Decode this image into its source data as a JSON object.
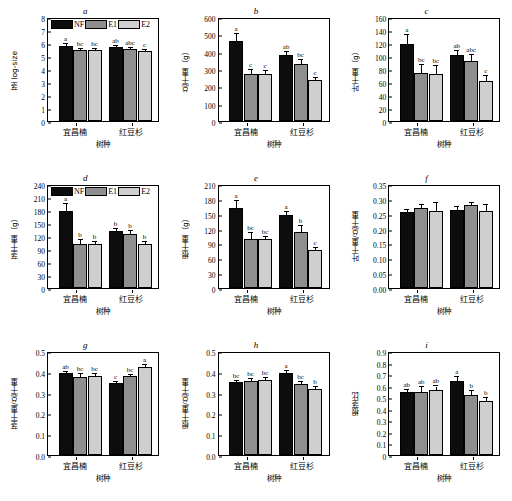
{
  "figure": {
    "categories": [
      "宜昌楠",
      "红豆杉"
    ],
    "xlabel": "树种",
    "legend": [
      {
        "key": "NF",
        "label": "NF",
        "color": "#0d0d0d"
      },
      {
        "key": "E1",
        "label": "E1",
        "color": "#8f8f8f"
      },
      {
        "key": "E2",
        "label": "E2",
        "color": "#cfcfcf"
      }
    ]
  },
  "chart_data": [
    {
      "type": "bar",
      "panel": "a",
      "title": "a",
      "ylabel": "茎 log-size",
      "xlabel": "树种",
      "categories": [
        "宜昌楠",
        "红豆杉"
      ],
      "ylim": [
        0,
        8
      ],
      "yticks": [
        "0",
        "1",
        "2",
        "3",
        "4",
        "5",
        "6",
        "7",
        "8"
      ],
      "grid": false,
      "legend_position": "top-left",
      "series": [
        {
          "name": "NF",
          "values": [
            5.8,
            5.7
          ],
          "errors": [
            0.1,
            0.09
          ],
          "letters": [
            "a",
            "ab"
          ]
        },
        {
          "name": "E1",
          "values": [
            5.5,
            5.55
          ],
          "errors": [
            0.07,
            0.06
          ],
          "letters": [
            "bc",
            "abc"
          ]
        },
        {
          "name": "E2",
          "values": [
            5.48,
            5.38
          ],
          "errors": [
            0.06,
            0.06
          ],
          "letters": [
            "bc",
            "c"
          ]
        }
      ]
    },
    {
      "type": "bar",
      "panel": "b",
      "title": "b",
      "ylabel": "总干重（g）",
      "xlabel": "树种",
      "categories": [
        "宜昌楠",
        "红豆杉"
      ],
      "ylim": [
        0,
        600
      ],
      "yticks": [
        "0",
        "100",
        "200",
        "300",
        "400",
        "500",
        "600"
      ],
      "grid": false,
      "legend_position": "none",
      "series": [
        {
          "name": "NF",
          "values": [
            460,
            382
          ],
          "errors": [
            42,
            18
          ],
          "letters": [
            "a",
            "ab"
          ]
        },
        {
          "name": "E1",
          "values": [
            270,
            330
          ],
          "errors": [
            22,
            24
          ],
          "letters": [
            "c",
            "bc"
          ]
        },
        {
          "name": "E2",
          "values": [
            272,
            237
          ],
          "errors": [
            18,
            14
          ],
          "letters": [
            "c",
            "c"
          ]
        }
      ]
    },
    {
      "type": "bar",
      "panel": "c",
      "title": "c",
      "ylabel": "叶干重（g）",
      "xlabel": "树种",
      "categories": [
        "宜昌楠",
        "红豆杉"
      ],
      "ylim": [
        0,
        160
      ],
      "yticks": [
        "0",
        "20",
        "40",
        "60",
        "80",
        "100",
        "120",
        "140",
        "160"
      ],
      "grid": false,
      "legend_position": "none",
      "series": [
        {
          "name": "NF",
          "values": [
            119,
            101
          ],
          "errors": [
            14,
            6
          ],
          "letters": [
            "a",
            "ab"
          ]
        },
        {
          "name": "E1",
          "values": [
            74,
            92
          ],
          "errors": [
            12,
            10
          ],
          "letters": [
            "bc",
            "abc"
          ]
        },
        {
          "name": "E2",
          "values": [
            72,
            62
          ],
          "errors": [
            12,
            7
          ],
          "letters": [
            "bc",
            "c"
          ]
        }
      ]
    },
    {
      "type": "bar",
      "panel": "d",
      "title": "d",
      "ylabel": "茎干重（g）",
      "xlabel": "树种",
      "categories": [
        "宜昌楠",
        "红豆杉"
      ],
      "ylim": [
        0,
        240
      ],
      "yticks": [
        "0",
        "30",
        "60",
        "90",
        "120",
        "150",
        "180",
        "210",
        "240"
      ],
      "grid": false,
      "legend_position": "top-left",
      "series": [
        {
          "name": "NF",
          "values": [
            178,
            131
          ],
          "errors": [
            15,
            6
          ],
          "letters": [
            "a",
            "b"
          ]
        },
        {
          "name": "E1",
          "values": [
            101,
            124
          ],
          "errors": [
            9,
            7
          ],
          "letters": [
            "b",
            "b"
          ]
        },
        {
          "name": "E2",
          "values": [
            102,
            101
          ],
          "errors": [
            5,
            5
          ],
          "letters": [
            "b",
            "b"
          ]
        }
      ]
    },
    {
      "type": "bar",
      "panel": "e",
      "title": "e",
      "ylabel": "根干重（g）",
      "xlabel": "树种",
      "categories": [
        "宜昌楠",
        "红豆杉"
      ],
      "ylim": [
        0,
        210
      ],
      "yticks": [
        "0",
        "30",
        "60",
        "90",
        "120",
        "150",
        "180",
        "210"
      ],
      "grid": false,
      "legend_position": "none",
      "series": [
        {
          "name": "NF",
          "values": [
            161,
            148
          ],
          "errors": [
            14,
            5
          ],
          "letters": [
            "a",
            "a"
          ]
        },
        {
          "name": "E1",
          "values": [
            98,
            113
          ],
          "errors": [
            13,
            12
          ],
          "letters": [
            "bc",
            "b"
          ]
        },
        {
          "name": "E2",
          "values": [
            99,
            77
          ],
          "errors": [
            4,
            4
          ],
          "letters": [
            "bc",
            "c"
          ]
        }
      ]
    },
    {
      "type": "bar",
      "panel": "f",
      "title": "f",
      "ylabel": "叶干重/总干重",
      "xlabel": "树种",
      "categories": [
        "宜昌楠",
        "红豆杉"
      ],
      "ylim": [
        0,
        0.35
      ],
      "yticks": [
        "0.00",
        "0.05",
        "0.10",
        "0.15",
        "0.20",
        "0.25",
        "0.30",
        "0.35"
      ],
      "grid": false,
      "legend_position": "none",
      "series": [
        {
          "name": "NF",
          "values": [
            0.256,
            0.264
          ],
          "errors": [
            0.006,
            0.01
          ],
          "letters": [
            "",
            ""
          ]
        },
        {
          "name": "E1",
          "values": [
            0.269,
            0.278
          ],
          "errors": [
            0.01,
            0.008
          ],
          "letters": [
            "",
            ""
          ]
        },
        {
          "name": "E2",
          "values": [
            0.26,
            0.259
          ],
          "errors": [
            0.025,
            0.02
          ],
          "letters": [
            "",
            ""
          ]
        }
      ]
    },
    {
      "type": "bar",
      "panel": "g",
      "title": "g",
      "ylabel": "茎干重/总干重",
      "xlabel": "树种",
      "categories": [
        "宜昌楠",
        "红豆杉"
      ],
      "ylim": [
        0,
        0.5
      ],
      "yticks": [
        "0.0",
        "0.1",
        "0.2",
        "0.3",
        "0.4",
        "0.5"
      ],
      "grid": false,
      "legend_position": "none",
      "series": [
        {
          "name": "NF",
          "values": [
            0.392,
            0.345
          ],
          "errors": [
            0.008,
            0.006
          ],
          "letters": [
            "ab",
            "c"
          ]
        },
        {
          "name": "E1",
          "values": [
            0.377,
            0.378
          ],
          "errors": [
            0.012,
            0.008
          ],
          "letters": [
            "bc",
            "bc"
          ]
        },
        {
          "name": "E2",
          "values": [
            0.379,
            0.423
          ],
          "errors": [
            0.01,
            0.01
          ],
          "letters": [
            "bc",
            "a"
          ]
        }
      ]
    },
    {
      "type": "bar",
      "panel": "h",
      "title": "h",
      "ylabel": "根干重/总干重",
      "xlabel": "树种",
      "categories": [
        "宜昌楠",
        "红豆杉"
      ],
      "ylim": [
        0,
        0.5
      ],
      "yticks": [
        "0.0",
        "0.1",
        "0.2",
        "0.3",
        "0.4",
        "0.5"
      ],
      "grid": false,
      "legend_position": "none",
      "series": [
        {
          "name": "NF",
          "values": [
            0.352,
            0.392
          ],
          "errors": [
            0.005,
            0.01
          ],
          "letters": [
            "bc",
            "a"
          ]
        },
        {
          "name": "E1",
          "values": [
            0.354,
            0.342
          ],
          "errors": [
            0.01,
            0.01
          ],
          "letters": [
            "bc",
            "bc"
          ]
        },
        {
          "name": "E2",
          "values": [
            0.361,
            0.318
          ],
          "errors": [
            0.008,
            0.008
          ],
          "letters": [
            "bc",
            "b"
          ]
        }
      ]
    },
    {
      "type": "bar",
      "panel": "i",
      "title": "i",
      "ylabel": "根茎比",
      "xlabel": "树种",
      "categories": [
        "宜昌楠",
        "红豆杉"
      ],
      "ylim": [
        0,
        0.9
      ],
      "yticks": [
        "0",
        "0.1",
        "0.2",
        "0.3",
        "0.4",
        "0.5",
        "0.6",
        "0.7",
        "0.8",
        "0.9"
      ],
      "grid": false,
      "legend_position": "none",
      "series": [
        {
          "name": "NF",
          "values": [
            0.545,
            0.642
          ],
          "errors": [
            0.018,
            0.035
          ],
          "letters": [
            "ab",
            "a"
          ]
        },
        {
          "name": "E1",
          "values": [
            0.548,
            0.52
          ],
          "errors": [
            0.04,
            0.03
          ],
          "letters": [
            "ab",
            "b"
          ]
        },
        {
          "name": "E2",
          "values": [
            0.563,
            0.468
          ],
          "errors": [
            0.03,
            0.022
          ],
          "letters": [
            "ab",
            "b"
          ]
        }
      ]
    }
  ]
}
